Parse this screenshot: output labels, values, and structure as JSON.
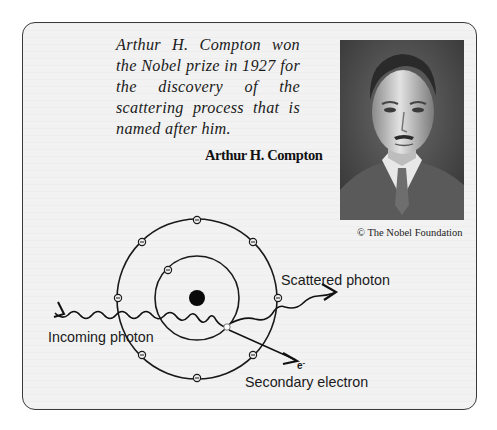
{
  "caption": {
    "quote": "Arthur H. Compton won the Nobel prize in 1927 for the discovery of the scattering process that is named after him.",
    "name": "Arthur H. Compton"
  },
  "photo": {
    "subject": "Portrait of Arthur H. Compton (black and white)",
    "credit": "© The Nobel Foundation"
  },
  "diagram": {
    "labels": {
      "incoming": "Incoming photon",
      "scattered": "Scattered photon",
      "secondary": "Secondary electron",
      "electron_symbol": "e",
      "electron_charge": "-"
    },
    "atom": {
      "nucleus": "filled black circle",
      "inner_shell_electrons": 1,
      "outer_shell_electrons": 8,
      "ejected_electron": "hollow circle on inner shell"
    }
  }
}
